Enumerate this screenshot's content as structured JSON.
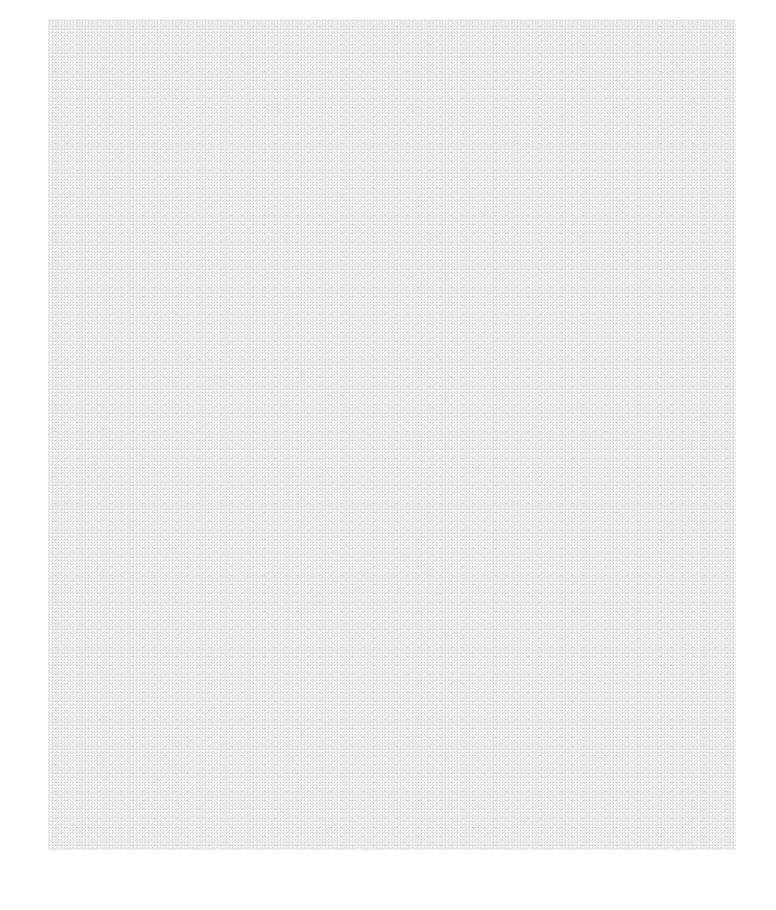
{
  "document": {
    "type": "blank-page",
    "text": "",
    "colors": {
      "page_background": "#eaeaea",
      "surrounding_background": "#ffffff"
    }
  }
}
